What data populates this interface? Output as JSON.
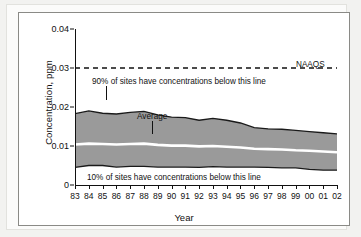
{
  "figure": {
    "ylabel": "Concentration, ppm",
    "xlabel": "Year",
    "annotations": {
      "p90": "90% of sites have concentrations below this line",
      "p10": "10% of sites have concentrations below this line",
      "average": "Average",
      "naaqs": "NAAQS"
    }
  },
  "chart_data": {
    "type": "area",
    "title": "",
    "xlabel": "Year",
    "ylabel": "Concentration, ppm",
    "xlim": [
      1983,
      2002
    ],
    "ylim": [
      0,
      0.04
    ],
    "grid": false,
    "legend_position": "none",
    "xtick_labels": [
      "83",
      "84",
      "85",
      "86",
      "87",
      "88",
      "89",
      "90",
      "91",
      "92",
      "93",
      "94",
      "95",
      "96",
      "97",
      "98",
      "99",
      "00",
      "01",
      "02"
    ],
    "ytick_labels": [
      "0",
      "0.01",
      "0.02",
      "0.03",
      "0.04"
    ],
    "ytick_values": [
      0,
      0.01,
      0.02,
      0.03,
      0.04
    ],
    "x": [
      1983,
      1984,
      1985,
      1986,
      1987,
      1988,
      1989,
      1990,
      1991,
      1992,
      1993,
      1994,
      1995,
      1996,
      1997,
      1998,
      1999,
      2000,
      2001,
      2002
    ],
    "series": [
      {
        "name": "90% of sites have concentrations below this line",
        "role": "band-upper",
        "values": [
          0.0183,
          0.019,
          0.0184,
          0.0182,
          0.0186,
          0.0189,
          0.018,
          0.0174,
          0.0173,
          0.0166,
          0.0171,
          0.0166,
          0.0159,
          0.0147,
          0.0144,
          0.0143,
          0.014,
          0.0137,
          0.0134,
          0.0131
        ]
      },
      {
        "name": "Average",
        "role": "center-line",
        "values": [
          0.0104,
          0.0106,
          0.0105,
          0.0104,
          0.0105,
          0.0106,
          0.0103,
          0.0101,
          0.0101,
          0.0099,
          0.01,
          0.0098,
          0.0096,
          0.0093,
          0.0092,
          0.0091,
          0.0089,
          0.0088,
          0.0086,
          0.0084
        ]
      },
      {
        "name": "10% of sites have concentrations below this line",
        "role": "band-lower",
        "values": [
          0.0045,
          0.005,
          0.005,
          0.0046,
          0.0048,
          0.0048,
          0.0046,
          0.0046,
          0.0046,
          0.0045,
          0.0047,
          0.0046,
          0.0046,
          0.0046,
          0.0045,
          0.0044,
          0.0044,
          0.004,
          0.0038,
          0.0038
        ]
      }
    ],
    "reference_lines": [
      {
        "name": "NAAQS",
        "value": 0.03,
        "style": "dashed",
        "label": "NAAQS"
      }
    ],
    "colors": {
      "band_fill": "#9a9a9a",
      "average_line": "#ffffff",
      "band_outline": "#1a1a1a",
      "reference_line": "#111111",
      "axis": "#111111",
      "background": "#ffffff"
    }
  }
}
